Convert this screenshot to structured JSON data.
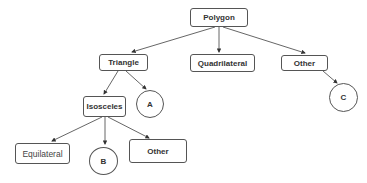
{
  "diagram": {
    "type": "tree",
    "nodes": {
      "polygon": {
        "label": "Polygon"
      },
      "triangle": {
        "label": "Triangle"
      },
      "quadrilateral": {
        "label": "Quadrilateral"
      },
      "other_top": {
        "label": "Other"
      },
      "isosceles": {
        "label": "Isosceles"
      },
      "a": {
        "label": "A"
      },
      "c": {
        "label": "C"
      },
      "equilateral": {
        "label": "Equilateral"
      },
      "b": {
        "label": "B"
      },
      "other_bottom": {
        "label": "Other"
      }
    },
    "edges": [
      [
        "Polygon",
        "Triangle"
      ],
      [
        "Polygon",
        "Quadrilateral"
      ],
      [
        "Polygon",
        "Other"
      ],
      [
        "Triangle",
        "Isosceles"
      ],
      [
        "Triangle",
        "A"
      ],
      [
        "Other",
        "C"
      ],
      [
        "Isosceles",
        "Equilateral"
      ],
      [
        "Isosceles",
        "B"
      ],
      [
        "Isosceles",
        "Other"
      ]
    ]
  }
}
